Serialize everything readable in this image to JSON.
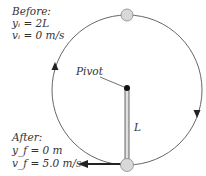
{
  "before": {
    "title": "Before:",
    "y": "yᵢ = 2L",
    "v": "vᵢ = 0 m/s"
  },
  "after": {
    "title": "After:",
    "y": "y_f = 0 m",
    "v": "v_f = 5.0 m/s"
  },
  "pivot_label": "Pivot",
  "length_label": "L",
  "colors": {
    "ball": "#d8d8d8",
    "ball_stroke": "#888888",
    "rod": "#d0d0d0",
    "path": "#555555",
    "arrow": "#222222"
  }
}
